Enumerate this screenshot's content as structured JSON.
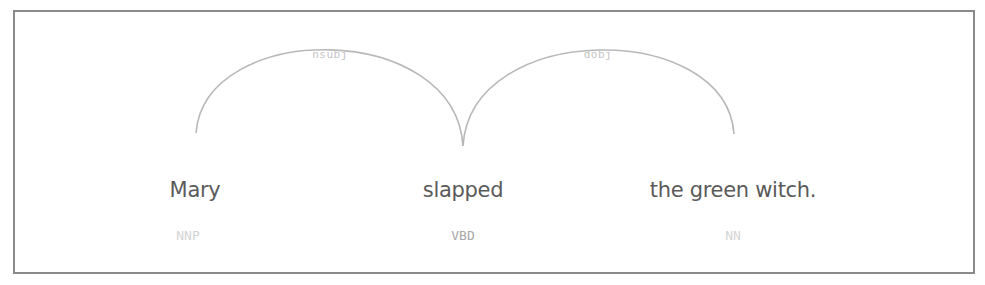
{
  "diagram": {
    "type": "dependency-parse",
    "tokens": [
      {
        "text": "Mary",
        "tag": "NNP",
        "x": 195,
        "tag_x": 188
      },
      {
        "text": "slapped",
        "tag": "VBD",
        "x": 463,
        "tag_x": 463
      },
      {
        "text": "the green witch.",
        "tag": "NN",
        "x": 733,
        "tag_x": 733
      }
    ],
    "arcs": [
      {
        "label": "nsubj",
        "from": "slapped",
        "to": "Mary",
        "label_x": 330
      },
      {
        "label": "dobj",
        "from": "slapped",
        "to": "the green witch.",
        "label_x": 598
      }
    ],
    "colors": {
      "border": "#8a8a8a",
      "arc": "#b8b8b8",
      "token_text": "#5a5a5a",
      "tag_text": "#a8a8a8",
      "arc_label": "#c4c4c4"
    }
  }
}
